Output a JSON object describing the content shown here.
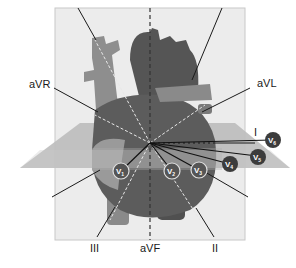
{
  "diagram": {
    "limb_leads": [
      {
        "id": "aVR",
        "label": "aVR"
      },
      {
        "id": "aVL",
        "label": "aVL"
      },
      {
        "id": "I",
        "label": "I"
      },
      {
        "id": "II",
        "label": "II"
      },
      {
        "id": "III",
        "label": "III"
      },
      {
        "id": "aVF",
        "label": "aVF"
      }
    ],
    "precordial_leads": [
      {
        "id": "V1",
        "label": "V",
        "sub": "1"
      },
      {
        "id": "V2",
        "label": "V",
        "sub": "2"
      },
      {
        "id": "V3",
        "label": "V",
        "sub": "3"
      },
      {
        "id": "V4",
        "label": "V",
        "sub": "4"
      },
      {
        "id": "V5",
        "label": "V",
        "sub": "5"
      },
      {
        "id": "V6",
        "label": "V",
        "sub": "6"
      }
    ],
    "colors": {
      "frontal_plane": "#e8e8e8",
      "horizontal_plane": "#b8b8b8",
      "heart_dark": "#5a5a5a",
      "heart_mid": "#7a7a7a",
      "vessel_light": "#9a9a9a",
      "lead_circle": "#3c3c3c",
      "line": "#1a1a1a"
    }
  }
}
